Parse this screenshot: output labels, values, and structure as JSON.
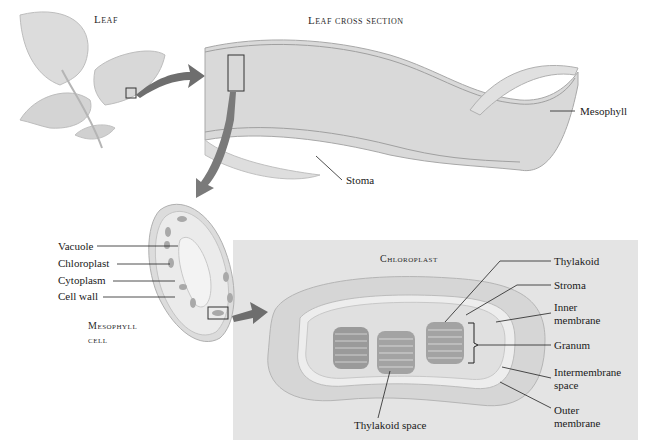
{
  "leaf": {
    "title": "Leaf"
  },
  "cross_section": {
    "title": "Leaf cross section",
    "labels": {
      "mesophyll": "Mesophyll",
      "stoma": "Stoma"
    }
  },
  "mesophyll_cell": {
    "title_line1": "Mesophyll",
    "title_line2": "cell",
    "labels": {
      "vacuole": "Vacuole",
      "chloroplast": "Chloroplast",
      "cytoplasm": "Cytoplasm",
      "cell_wall": "Cell wall"
    }
  },
  "chloroplast": {
    "title": "Chloroplast",
    "labels": {
      "thylakoid": "Thylakoid",
      "stroma": "Stroma",
      "inner_membrane_1": "Inner",
      "inner_membrane_2": "membrane",
      "granum": "Granum",
      "intermembrane_1": "Intermembrane",
      "intermembrane_2": "space",
      "outer_membrane_1": "Outer",
      "outer_membrane_2": "membrane",
      "thylakoid_space": "Thylakoid space"
    }
  },
  "colors": {
    "panel_bg": "#e4e4e4",
    "tissue": "#d6d6d6",
    "arrow": "#6e6e6e",
    "line": "#222222"
  }
}
